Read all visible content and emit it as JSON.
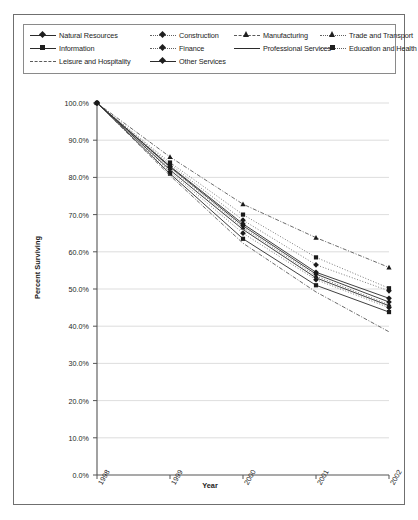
{
  "chart_data": {
    "type": "line",
    "title": "",
    "xlabel": "Year",
    "ylabel": "Percent Surviving",
    "x": [
      "1998",
      "1999",
      "2000",
      "2001",
      "2002"
    ],
    "ylim": [
      0,
      100
    ],
    "ytick_labels": [
      "100.0%",
      "90.0%",
      "80.0%",
      "70.0%",
      "60.0%",
      "50.0%",
      "40.0%",
      "30.0%",
      "20.0%",
      "10.0%",
      "0.0%"
    ],
    "ytick_values": [
      100,
      90,
      80,
      70,
      60,
      50,
      40,
      30,
      20,
      10,
      0
    ],
    "grid": true,
    "legend_position": "top",
    "series": [
      {
        "name": "Natural Resources",
        "values": [
          100.0,
          83.0,
          67.5,
          54.5,
          47.5
        ],
        "style": "solid",
        "marker": "diamond"
      },
      {
        "name": "Construction",
        "values": [
          100.0,
          81.5,
          65.0,
          52.5,
          45.0
        ],
        "style": "dotted",
        "marker": "diamond"
      },
      {
        "name": "Manufacturing",
        "values": [
          100.0,
          85.5,
          72.8,
          63.8,
          55.8
        ],
        "style": "dashdot",
        "marker": "triangle"
      },
      {
        "name": "Trade and Transport",
        "values": [
          100.0,
          82.5,
          66.5,
          53.5,
          45.8
        ],
        "style": "dotted",
        "marker": "triangle"
      },
      {
        "name": "Information",
        "values": [
          100.0,
          81.0,
          63.5,
          51.0,
          43.8
        ],
        "style": "solid",
        "marker": "square"
      },
      {
        "name": "Finance",
        "values": [
          100.0,
          83.5,
          68.5,
          56.5,
          49.5
        ],
        "style": "dotted",
        "marker": "diamond"
      },
      {
        "name": "Professional Services",
        "values": [
          100.0,
          82.0,
          66.0,
          53.0,
          45.5
        ],
        "style": "solid",
        "marker": "none"
      },
      {
        "name": "Education and Health",
        "values": [
          100.0,
          84.0,
          70.0,
          58.5,
          50.2
        ],
        "style": "dotted",
        "marker": "square"
      },
      {
        "name": "Leisure and Hospitality",
        "values": [
          100.0,
          80.5,
          62.3,
          49.2,
          38.5
        ],
        "style": "dashdot",
        "marker": "none"
      },
      {
        "name": "Other Services",
        "values": [
          100.0,
          82.8,
          67.0,
          54.0,
          46.5
        ],
        "style": "solid",
        "marker": "diamond"
      }
    ]
  },
  "legend": {
    "columns": [
      [
        {
          "label": "Natural Resources",
          "style": "solid",
          "marker": "diamond"
        },
        {
          "label": "Information",
          "style": "solid",
          "marker": "square"
        },
        {
          "label": "Leisure and Hospitality",
          "style": "dashdot",
          "marker": "none"
        }
      ],
      [
        {
          "label": "Construction",
          "style": "dotted",
          "marker": "diamond"
        },
        {
          "label": "Finance",
          "style": "dotted",
          "marker": "diamond"
        },
        {
          "label": "Other Services",
          "style": "solid",
          "marker": "diamond"
        }
      ],
      [
        {
          "label": "Manufacturing",
          "style": "dashdot",
          "marker": "triangle"
        },
        {
          "label": "Professional Services",
          "style": "solid",
          "marker": "none"
        }
      ],
      [
        {
          "label": "Trade and Transport",
          "style": "dotted",
          "marker": "triangle"
        },
        {
          "label": "Education and Health",
          "style": "dotted",
          "marker": "square"
        }
      ]
    ]
  }
}
